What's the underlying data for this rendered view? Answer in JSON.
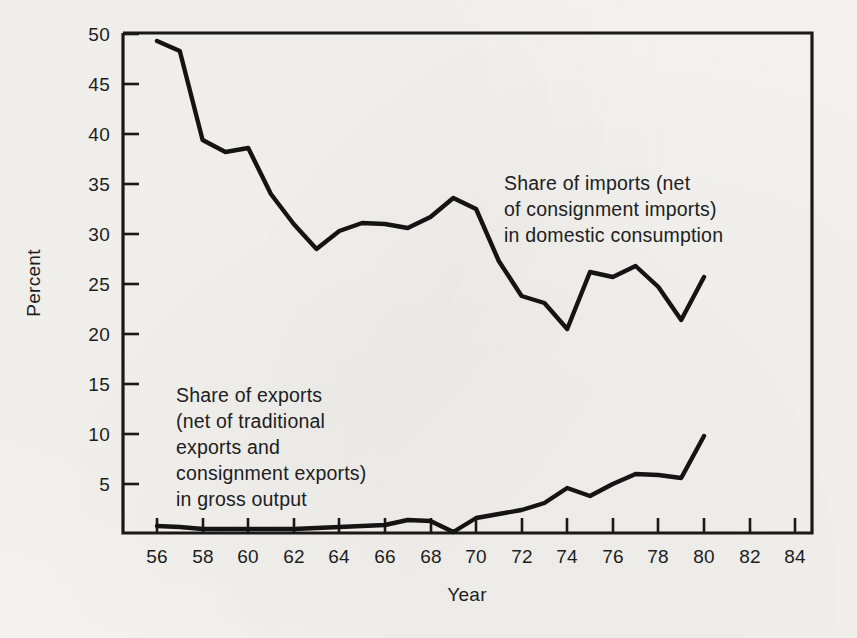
{
  "chart_data": {
    "type": "line",
    "title": "",
    "xlabel": "Year",
    "ylabel": "Percent",
    "xlim": [
      55,
      85
    ],
    "ylim": [
      0,
      52
    ],
    "xticks": [
      "56",
      "58",
      "60",
      "62",
      "64",
      "66",
      "68",
      "70",
      "72",
      "74",
      "76",
      "78",
      "80",
      "82",
      "84"
    ],
    "yticks": [
      "5",
      "10",
      "15",
      "20",
      "25",
      "30",
      "35",
      "40",
      "45",
      "50"
    ],
    "grid": false,
    "legend": "annotations-inline",
    "x": [
      1956,
      1957,
      1958,
      1959,
      1960,
      1961,
      1962,
      1963,
      1964,
      1965,
      1966,
      1967,
      1968,
      1969,
      1970,
      1971,
      1972,
      1973,
      1974,
      1975,
      1976,
      1977,
      1978,
      1979,
      1980
    ],
    "series": [
      {
        "name": "Share of imports (net of consignment imports) in domestic consumption",
        "values": [
          49.3,
          48.3,
          39.4,
          38.2,
          38.6,
          34.0,
          31.0,
          28.5,
          30.3,
          31.1,
          31.0,
          30.6,
          31.7,
          33.6,
          32.5,
          27.3,
          23.8,
          23.1,
          20.5,
          26.2,
          25.7,
          26.8,
          24.7,
          21.4,
          25.7
        ]
      },
      {
        "name": "Share of exports (net of traditional exports and consignment exports) in gross output",
        "values": [
          0.8,
          0.7,
          0.5,
          0.5,
          0.5,
          0.5,
          0.5,
          0.6,
          0.7,
          0.8,
          0.9,
          1.4,
          1.3,
          0.2,
          1.6,
          2.0,
          2.4,
          3.1,
          4.6,
          3.8,
          5.0,
          6.0,
          5.9,
          5.6,
          9.8
        ]
      }
    ],
    "annotations": [
      {
        "id": "imports-annotation",
        "lines": [
          "Share of imports (net",
          "of consignment imports)",
          "in domestic consumption"
        ]
      },
      {
        "id": "exports-annotation",
        "lines": [
          "Share of exports",
          "(net of traditional",
          "exports and",
          "consignment exports)",
          "in gross output"
        ]
      }
    ],
    "colors": {
      "background": "#f3f2ef",
      "ink": "#191919",
      "series_line": "#141414"
    }
  }
}
